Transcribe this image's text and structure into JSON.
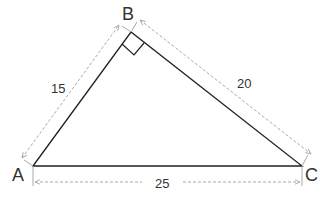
{
  "diagram": {
    "type": "right-triangle",
    "vertices": {
      "A": {
        "label": "A",
        "x": 33,
        "y": 166
      },
      "B": {
        "label": "B",
        "x": 131,
        "y": 32
      },
      "C": {
        "label": "C",
        "x": 302,
        "y": 166
      }
    },
    "right_angle_at": "B",
    "sides": {
      "AB": {
        "length_label": "15"
      },
      "BC": {
        "length_label": "20"
      },
      "AC": {
        "length_label": "25"
      }
    },
    "colors": {
      "triangle_stroke": "#222222",
      "dimension_stroke": "#aaaaaa",
      "text": "#333333"
    }
  }
}
